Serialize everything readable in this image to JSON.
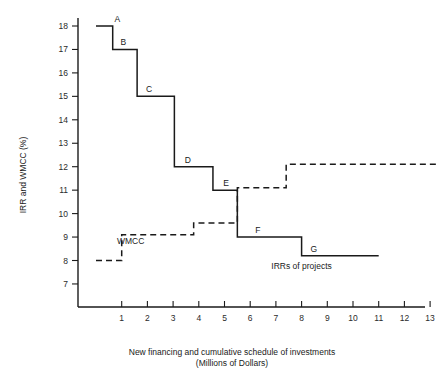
{
  "chart_data": {
    "type": "line",
    "title": "",
    "xlabel": "New financing and cumulative schedule of investments (Millions of Dollars)",
    "xlabel_line1": "New financing and cumulative schedule of investments",
    "xlabel_line2": "(Millions of Dollars)",
    "ylabel": "IRR and WMCC (%)",
    "xlim": [
      0,
      13.6
    ],
    "ylim": [
      6,
      18.3
    ],
    "grid": false,
    "legend_position": "inline-annotations",
    "x_ticks": [
      1,
      2,
      3,
      4,
      5,
      6,
      7,
      8,
      9,
      10,
      11,
      12,
      13
    ],
    "x_tick_labels": [
      "1",
      "2",
      "3",
      "4",
      "5",
      "6",
      "7",
      "8",
      "9",
      "10",
      "11",
      "12",
      "13"
    ],
    "y_ticks": [
      7,
      8,
      9,
      10,
      11,
      12,
      13,
      14,
      15,
      16,
      17,
      18
    ],
    "y_tick_labels": [
      "7",
      "8",
      "9",
      "10",
      "11",
      "12",
      "13",
      "14",
      "15",
      "16",
      "17",
      "18"
    ],
    "series": [
      {
        "name": "IRRs of projects",
        "style": "solid",
        "step_type": "post",
        "annotation": "IRRs of projects",
        "steps": [
          {
            "label": "A",
            "x_start": 0.0,
            "x_end": 0.65,
            "y": 18.0
          },
          {
            "label": "B",
            "x_start": 0.65,
            "x_end": 1.6,
            "y": 17.0
          },
          {
            "label": "C",
            "x_start": 1.6,
            "x_end": 3.05,
            "y": 15.0
          },
          {
            "label": "D",
            "x_start": 3.05,
            "x_end": 4.55,
            "y": 12.0
          },
          {
            "label": "E",
            "x_start": 4.55,
            "x_end": 5.5,
            "y": 11.0
          },
          {
            "label": "F",
            "x_start": 5.5,
            "x_end": 8.0,
            "y": 9.0
          },
          {
            "label": "G",
            "x_start": 8.0,
            "x_end": 11.0,
            "y": 8.2
          }
        ]
      },
      {
        "name": "WMCC",
        "style": "dashed",
        "step_type": "post",
        "annotation": "WMCC",
        "steps": [
          {
            "label": "",
            "x_start": 0.0,
            "x_end": 1.0,
            "y": 8.0
          },
          {
            "label": "",
            "x_start": 1.0,
            "x_end": 3.8,
            "y": 9.1
          },
          {
            "label": "",
            "x_start": 3.8,
            "x_end": 5.5,
            "y": 9.6
          },
          {
            "label": "",
            "x_start": 5.5,
            "x_end": 7.4,
            "y": 11.1
          },
          {
            "label": "",
            "x_start": 7.4,
            "x_end": 13.3,
            "y": 12.1
          }
        ]
      }
    ],
    "annotations": [
      {
        "text": "A",
        "x": 0.72,
        "y": 18.0,
        "name": "point-label-a"
      },
      {
        "text": "B",
        "x": 0.95,
        "y": 17.0,
        "name": "point-label-b"
      },
      {
        "text": "C",
        "x": 1.95,
        "y": 15.0,
        "name": "point-label-c"
      },
      {
        "text": "D",
        "x": 3.45,
        "y": 12.0,
        "name": "point-label-d"
      },
      {
        "text": "E",
        "x": 4.95,
        "y": 11.0,
        "name": "point-label-e"
      },
      {
        "text": "F",
        "x": 6.2,
        "y": 9.0,
        "name": "point-label-f"
      },
      {
        "text": "G",
        "x": 8.35,
        "y": 8.2,
        "name": "point-label-g"
      },
      {
        "text": "WMCC",
        "x": 1.35,
        "y": 8.55,
        "name": "series-label-wmcc"
      },
      {
        "text": "IRRs of projects",
        "x": 8.0,
        "y": 7.45,
        "name": "series-label-irrs"
      }
    ],
    "colors": {
      "line": "#1a1a1a",
      "axis": "#1a1a1a",
      "background": "#ffffff",
      "text": "#1a1a1a"
    }
  }
}
